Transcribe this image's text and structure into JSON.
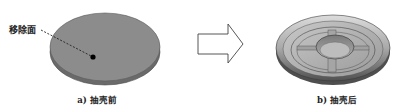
{
  "figure": {
    "left_panel": {
      "annotation_label": "移除面",
      "caption": "a) 抽壳前",
      "object": "solid-disk",
      "colors": {
        "top_face": "#8c8c8c",
        "side_face": "#6a6a6a",
        "outline": "#555555"
      }
    },
    "arrow": {
      "direction": "right",
      "style": "hollow-outline"
    },
    "right_panel": {
      "caption": "b) 抽壳后",
      "object": "shelled-dish",
      "colors": {
        "rim": "#a8a8a8",
        "inner": "#bdbdbd",
        "shadow": "#5a5a5a"
      }
    }
  }
}
